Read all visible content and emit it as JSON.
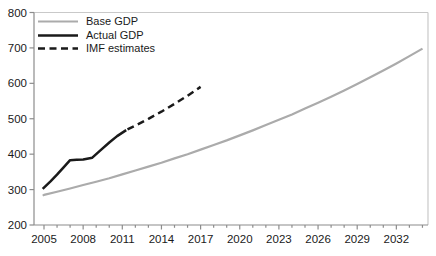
{
  "chart_data": {
    "type": "line",
    "title": "",
    "xlabel": "",
    "ylabel": "",
    "ylim": [
      200,
      800
    ],
    "xlim": [
      2004.2,
      2034.4
    ],
    "y_ticks": [
      200,
      300,
      400,
      500,
      600,
      700,
      800
    ],
    "x_major_ticks": [
      2005,
      2008,
      2011,
      2014,
      2017,
      2020,
      2023,
      2026,
      2029,
      2032
    ],
    "x_minor_tick_range": [
      2005,
      2034
    ],
    "grid": false,
    "legend_position": "top-left",
    "colors": {
      "base_gdp": "#ababab",
      "actual_gdp": "#1a1a1a",
      "imf_estimates": "#1a1a1a",
      "axis": "#8c8c8c",
      "border": "#c9c9c9",
      "tick_text": "#1a1a1a",
      "background": "#ffffff"
    },
    "series": [
      {
        "name": "Base GDP",
        "color": "#ababab",
        "width": 2.2,
        "dash": "",
        "points": [
          [
            2004.9,
            283
          ],
          [
            2005,
            285
          ],
          [
            2006,
            294
          ],
          [
            2007,
            303
          ],
          [
            2008,
            313
          ],
          [
            2009,
            322
          ],
          [
            2010,
            332
          ],
          [
            2011,
            343
          ],
          [
            2012,
            354
          ],
          [
            2013,
            365
          ],
          [
            2014,
            376
          ],
          [
            2015,
            388
          ],
          [
            2016,
            400
          ],
          [
            2017,
            413
          ],
          [
            2018,
            426
          ],
          [
            2019,
            439
          ],
          [
            2020,
            453
          ],
          [
            2021,
            467
          ],
          [
            2022,
            482
          ],
          [
            2023,
            497
          ],
          [
            2024,
            512
          ],
          [
            2025,
            529
          ],
          [
            2026,
            545
          ],
          [
            2027,
            562
          ],
          [
            2028,
            580
          ],
          [
            2029,
            598
          ],
          [
            2030,
            617
          ],
          [
            2031,
            636
          ],
          [
            2032,
            656
          ],
          [
            2033,
            677
          ],
          [
            2034,
            698
          ]
        ]
      },
      {
        "name": "Actual GDP",
        "color": "#1a1a1a",
        "width": 2.5,
        "dash": "",
        "points": [
          [
            2004.9,
            302
          ],
          [
            2005.5,
            323
          ],
          [
            2006,
            342
          ],
          [
            2006.5,
            363
          ],
          [
            2007,
            383
          ],
          [
            2007.5,
            384
          ],
          [
            2008,
            385
          ],
          [
            2008.7,
            390
          ],
          [
            2009.3,
            410
          ],
          [
            2010,
            433
          ],
          [
            2010.6,
            451
          ],
          [
            2011.3,
            468
          ]
        ]
      },
      {
        "name": "IMF estimates",
        "color": "#1a1a1a",
        "width": 2.5,
        "dash": "7 4.5",
        "points": [
          [
            2011.4,
            470
          ],
          [
            2012,
            481
          ],
          [
            2013,
            500
          ],
          [
            2014,
            520
          ],
          [
            2015,
            542
          ],
          [
            2016,
            565
          ],
          [
            2017,
            590
          ]
        ]
      }
    ]
  }
}
